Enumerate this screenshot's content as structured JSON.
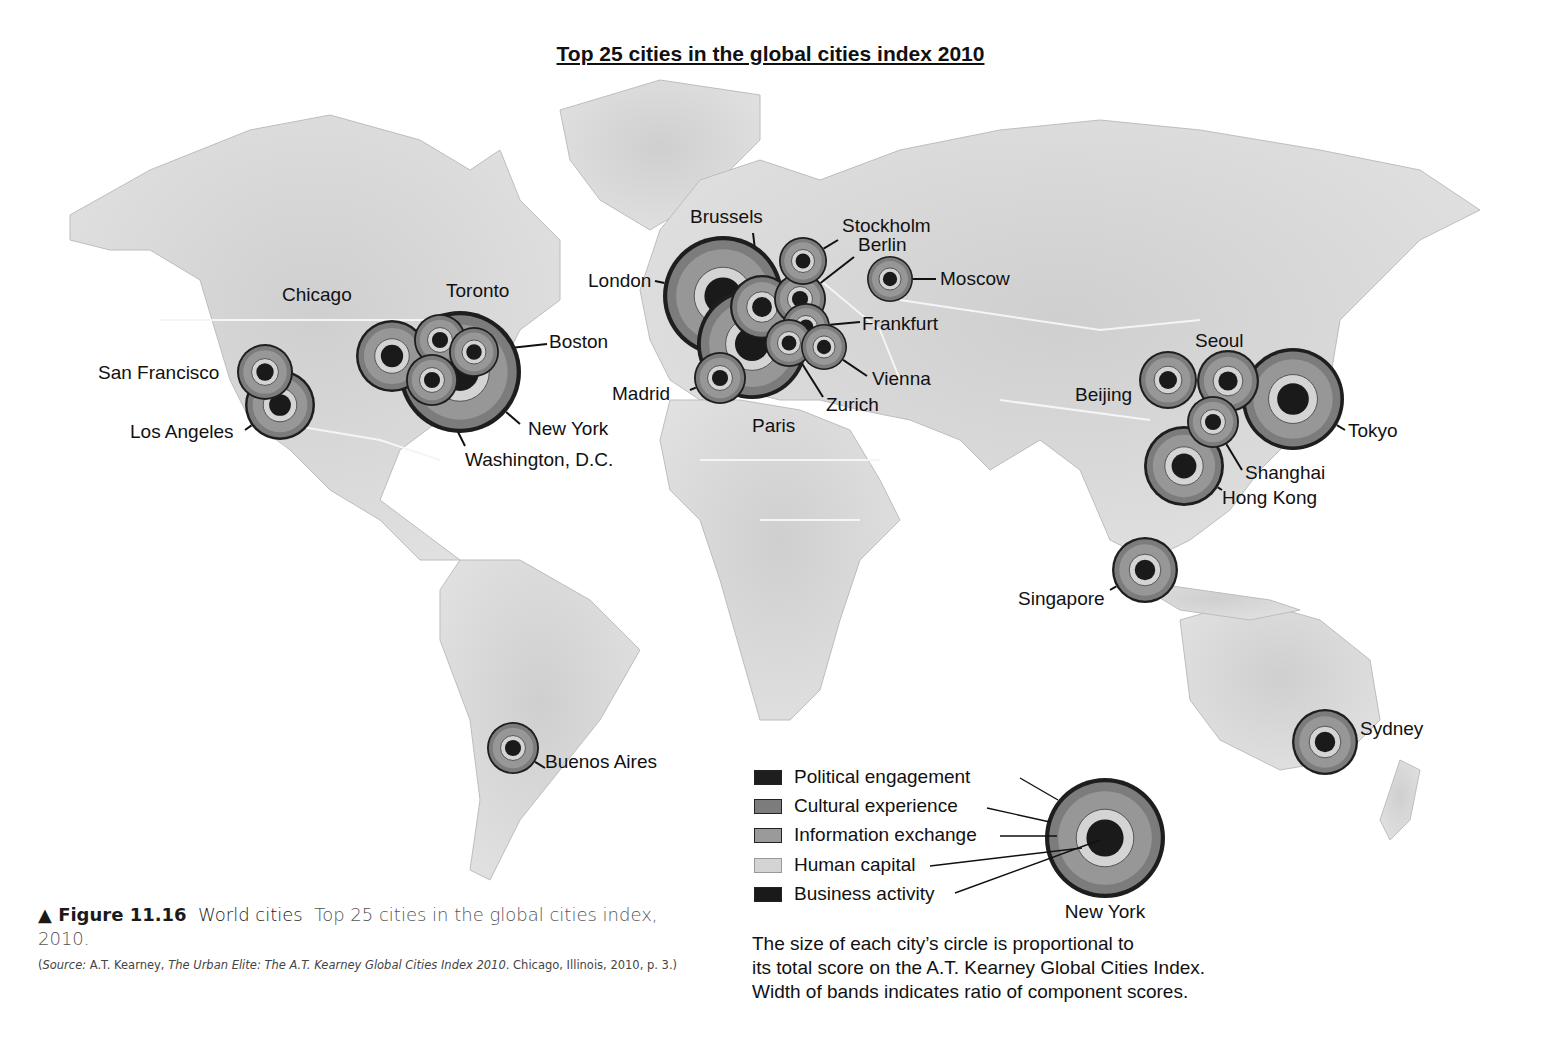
{
  "title": "Top 25 cities in the global cities index 2010",
  "colors": {
    "political_engagement": "#1e1e1e",
    "cultural_experience": "#7c7c7c",
    "information_exchange": "#9a9a9a",
    "human_capital": "#d4d4d4",
    "business_activity": "#1a1a1a",
    "land": "#d9d9d9",
    "ocean": "#ffffff",
    "border": "#f5f5f5"
  },
  "legend": {
    "items": [
      {
        "key": "political_engagement",
        "label": "Political engagement"
      },
      {
        "key": "cultural_experience",
        "label": "Cultural experience"
      },
      {
        "key": "information_exchange",
        "label": "Information exchange"
      },
      {
        "key": "human_capital",
        "label": "Human capital"
      },
      {
        "key": "business_activity",
        "label": "Business activity"
      }
    ],
    "example_city": "New York",
    "note_lines": [
      "The size of each city’s circle is proportional to",
      "its total score on the A.T. Kearney Global Cities Index.",
      "Width of bands indicates ratio of component scores."
    ]
  },
  "cities": [
    {
      "name": "London",
      "label": "London",
      "region": "Europe"
    },
    {
      "name": "Paris",
      "label": "Paris",
      "region": "Europe"
    },
    {
      "name": "Brussels",
      "label": "Brussels",
      "region": "Europe"
    },
    {
      "name": "Stockholm",
      "label": "Stockholm",
      "region": "Europe"
    },
    {
      "name": "Berlin",
      "label": "Berlin",
      "region": "Europe"
    },
    {
      "name": "Frankfurt",
      "label": "Frankfurt",
      "region": "Europe"
    },
    {
      "name": "Vienna",
      "label": "Vienna",
      "region": "Europe"
    },
    {
      "name": "Zurich",
      "label": "Zurich",
      "region": "Europe"
    },
    {
      "name": "Madrid",
      "label": "Madrid",
      "region": "Europe"
    },
    {
      "name": "Moscow",
      "label": "Moscow",
      "region": "Europe"
    },
    {
      "name": "New York",
      "label": "New York",
      "region": "North America"
    },
    {
      "name": "Chicago",
      "label": "Chicago",
      "region": "North America"
    },
    {
      "name": "Toronto",
      "label": "Toronto",
      "region": "North America"
    },
    {
      "name": "Boston",
      "label": "Boston",
      "region": "North America"
    },
    {
      "name": "Washington, D.C.",
      "label": "Washington, D.C.",
      "region": "North America"
    },
    {
      "name": "San Francisco",
      "label": "San Francisco",
      "region": "North America"
    },
    {
      "name": "Los Angeles",
      "label": "Los Angeles",
      "region": "North America"
    },
    {
      "name": "Buenos Aires",
      "label": "Buenos Aires",
      "region": "South America"
    },
    {
      "name": "Tokyo",
      "label": "Tokyo",
      "region": "Asia"
    },
    {
      "name": "Beijing",
      "label": "Beijing",
      "region": "Asia"
    },
    {
      "name": "Seoul",
      "label": "Seoul",
      "region": "Asia"
    },
    {
      "name": "Shanghai",
      "label": "Shanghai",
      "region": "Asia"
    },
    {
      "name": "Hong Kong",
      "label": "Hong Kong",
      "region": "Asia"
    },
    {
      "name": "Singapore",
      "label": "Singapore",
      "region": "Asia"
    },
    {
      "name": "Sydney",
      "label": "Sydney",
      "region": "Oceania"
    }
  ],
  "caption": {
    "marker": "▲",
    "figure": "Figure 11.16",
    "name": "World cities",
    "text": "Top 25 cities in the global cities index, 2010.",
    "source_prefix": "(",
    "source_label": "Source:",
    "source_author": " A.T. Kearney, ",
    "source_title": "The Urban Elite: The A.T. Kearney Global Cities Index 2010",
    "source_rest": ". Chicago, Illinois, 2010, p. 3.)"
  }
}
